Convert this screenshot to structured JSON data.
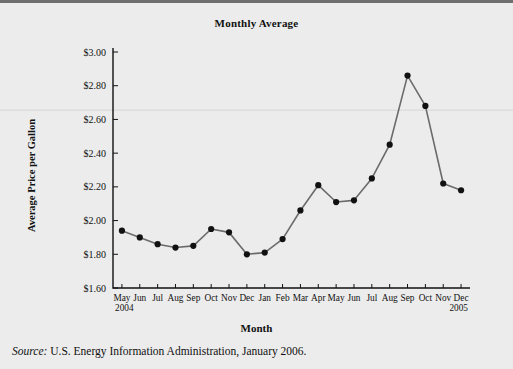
{
  "figure": {
    "title": "Monthly Average",
    "xlabel": "Month",
    "ylabel": "Average Price per Gallon",
    "source_word": "Source:",
    "source_text": " U.S. Energy Information Administration, January 2006.",
    "line_color": "#6b6b6b",
    "marker_color": "#111111",
    "background_color": "#ececec"
  },
  "chart_data": {
    "type": "line",
    "title": "Monthly Average",
    "xlabel": "Month",
    "ylabel": "Average Price per Gallon",
    "ylim": [
      1.6,
      3.0
    ],
    "ytick_labels": [
      "$3.00",
      "$2.80",
      "$2.60",
      "$2.40",
      "$2.20",
      "$2.00",
      "$1.80",
      "$1.60"
    ],
    "ytick_values": [
      3.0,
      2.8,
      2.6,
      2.4,
      2.2,
      2.0,
      1.8,
      1.6
    ],
    "grid": false,
    "legend": "none",
    "start_year": "2004",
    "end_year": "2005",
    "categories": [
      "May",
      "Jun",
      "Jul",
      "Aug",
      "Sep",
      "Oct",
      "Nov",
      "Dec",
      "Jan",
      "Feb",
      "Mar",
      "Apr",
      "May",
      "Jun",
      "Jul",
      "Aug",
      "Sep",
      "Oct",
      "Nov",
      "Dec"
    ],
    "values": [
      1.94,
      1.9,
      1.86,
      1.84,
      1.85,
      1.95,
      1.93,
      1.8,
      1.81,
      1.89,
      2.06,
      2.21,
      2.11,
      2.12,
      2.25,
      2.45,
      2.86,
      2.68,
      2.22,
      2.18
    ]
  }
}
